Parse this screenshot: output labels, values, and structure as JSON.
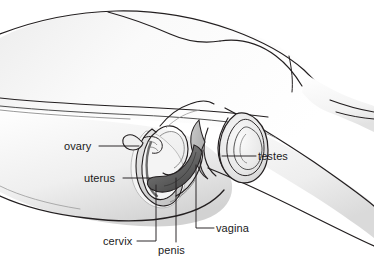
{
  "figure": {
    "type": "anatomical-line-drawing",
    "style": "grayscale pen-and-ink with airbrush shading",
    "background_color": "#ffffff",
    "outline_color": "#231f20",
    "shade_light": "#f2f2f2",
    "shade_mid": "#d9d9d9",
    "shade_dark": "#9a9a9a",
    "label_color": "#1a1a1a",
    "leader_color": "#231f20"
  },
  "labels": [
    {
      "id": "ovary",
      "text": "ovary",
      "x": 64,
      "y": 140,
      "anchor": "right"
    },
    {
      "id": "uterus",
      "text": "uterus",
      "x": 84,
      "y": 172,
      "anchor": "right"
    },
    {
      "id": "testes",
      "text": "testes",
      "x": 258,
      "y": 150,
      "anchor": "left"
    },
    {
      "id": "cervix",
      "text": "cervix",
      "x": 103,
      "y": 235,
      "anchor": "right"
    },
    {
      "id": "penis",
      "text": "penis",
      "x": 158,
      "y": 244,
      "anchor": "top"
    },
    {
      "id": "vagina",
      "text": "vagina",
      "x": 216,
      "y": 222,
      "anchor": "left"
    }
  ],
  "leaders": {
    "ovary": "M 99,146 L 139,146",
    "uterus": "M 123,178 L 150,178",
    "testes": "M 256,156 L 222,156",
    "cervix": "M 137,241 L 156,241 L 156,185",
    "penis": "M 176,242 L 176,178",
    "vagina": "M 214,228 L 196,228 L 196,165"
  },
  "top_artifact": {
    "present": true,
    "description": "clipped caption remnant row at very top edge, illegible"
  }
}
